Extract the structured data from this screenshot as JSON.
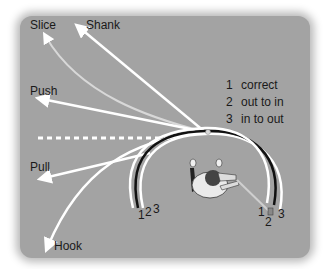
{
  "ball_flights": [
    {
      "id": "slice",
      "label": "Slice"
    },
    {
      "id": "shank",
      "label": "Shank"
    },
    {
      "id": "push",
      "label": "Push"
    },
    {
      "id": "pull",
      "label": "Pull"
    },
    {
      "id": "hook",
      "label": "Hook"
    }
  ],
  "legend": [
    {
      "num": "1",
      "text": "correct"
    },
    {
      "num": "2",
      "text": "out to in"
    },
    {
      "num": "3",
      "text": "in to out"
    }
  ],
  "swing_path_numbers": {
    "left": [
      "1",
      "2",
      "3"
    ],
    "right": [
      "1",
      "2",
      "3"
    ]
  },
  "colors": {
    "background": "#a3a3a3",
    "arrow": "#ffffff",
    "path_correct": "#ffffff",
    "path_out_to_in": "#111111",
    "path_in_to_out": "#ffffff"
  }
}
